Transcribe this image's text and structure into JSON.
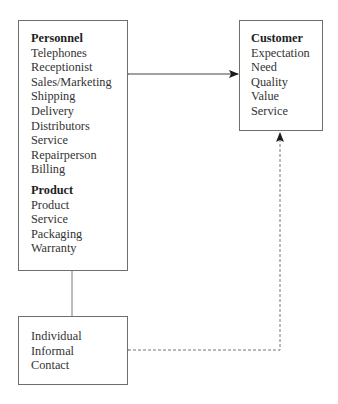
{
  "diagram": {
    "left_box": {
      "sections": [
        {
          "heading": "Personnel",
          "items": [
            "Telephones",
            "Receptionist",
            "Sales/Marketing",
            "Shipping",
            "Delivery",
            "Distributors",
            "Service",
            "Repairperson",
            "Billing"
          ]
        },
        {
          "heading": "Product",
          "items": [
            "Product",
            "Service",
            "Packaging",
            "Warranty"
          ]
        }
      ]
    },
    "customer_box": {
      "heading": "Customer",
      "items": [
        "Expectation",
        "Need",
        "Quality",
        "Value",
        "Service"
      ]
    },
    "contact_box": {
      "items": [
        "Individual",
        "Informal",
        "Contact"
      ]
    },
    "connectors": [
      {
        "from": "left_box",
        "to": "customer_box",
        "style": "solid",
        "direction": "bidirectional"
      },
      {
        "from": "left_box",
        "to": "contact_box",
        "style": "solid",
        "direction": "none"
      },
      {
        "from": "contact_box",
        "to": "customer_box",
        "style": "dashed",
        "direction": "bidirectional"
      }
    ],
    "colors": {
      "line": "#6e6e6e",
      "text": "#2a2a2a"
    }
  }
}
